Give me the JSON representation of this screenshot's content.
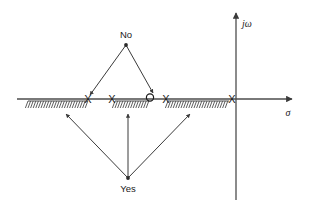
{
  "figure": {
    "type": "s-plane-pole-zero-diagram",
    "background": "#ffffff",
    "line_color": "#4d4d4d",
    "text_color": "#1a1a1a"
  },
  "axes": {
    "real": {
      "label": "σ",
      "name": "sigma-axis",
      "y": 99,
      "x_start": 17,
      "x_end": 292,
      "arrow": "right"
    },
    "imag": {
      "label": "jω",
      "name": "j-omega-axis",
      "x": 236,
      "y_top": 13,
      "y_bottom": 200,
      "arrow": "up"
    },
    "origin": {
      "x": 236,
      "y": 99
    }
  },
  "markers": [
    {
      "kind": "pole",
      "glyph": "X",
      "name": "pole-1",
      "x": 88,
      "y": 99
    },
    {
      "kind": "pole",
      "glyph": "X",
      "name": "pole-2",
      "x": 112,
      "y": 99
    },
    {
      "kind": "zero",
      "glyph": "O",
      "name": "zero-1",
      "x": 150,
      "y": 99
    },
    {
      "kind": "pole",
      "glyph": "X",
      "name": "pole-3",
      "x": 166,
      "y": 99
    },
    {
      "kind": "pole",
      "glyph": "X",
      "name": "pole-4",
      "x": 232,
      "y": 99
    }
  ],
  "hatched_segments": [
    {
      "name": "hatch-region-1",
      "x1": 28,
      "x2": 88,
      "y": 101
    },
    {
      "name": "hatch-region-2",
      "x1": 115,
      "x2": 149,
      "y": 101
    },
    {
      "name": "hatch-region-3",
      "x1": 168,
      "x2": 229,
      "y": 101
    }
  ],
  "annotations": {
    "no": {
      "label": "No",
      "name": "no-annotation",
      "text_x": 126,
      "text_y": 38,
      "apex_x": 126,
      "apex_y": 45,
      "targets": [
        {
          "name": "no-arrow-left",
          "x": 90,
          "y": 95
        },
        {
          "name": "no-arrow-right",
          "x": 153,
          "y": 93
        }
      ]
    },
    "yes": {
      "label": "Yes",
      "name": "yes-annotation",
      "text_x": 128,
      "text_y": 192,
      "apex_x": 128,
      "apex_y": 178,
      "targets": [
        {
          "name": "yes-arrow-left",
          "x": 66,
          "y": 114
        },
        {
          "name": "yes-arrow-center",
          "x": 128,
          "y": 114
        },
        {
          "name": "yes-arrow-right",
          "x": 190,
          "y": 114
        }
      ]
    }
  }
}
